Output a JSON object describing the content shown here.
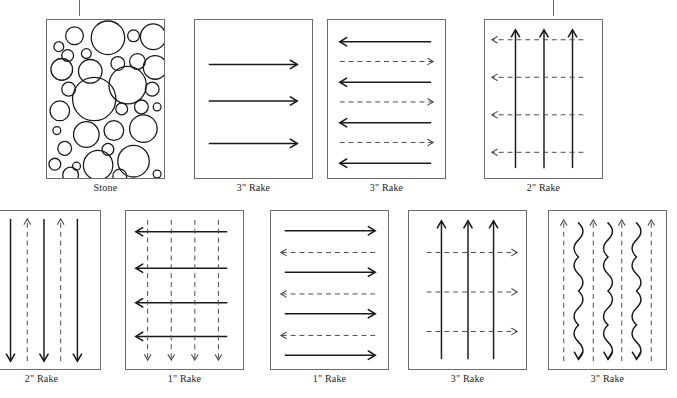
{
  "figure": {
    "title": "",
    "background_color": "#ffffff",
    "stroke_color": "#1a1a1a",
    "dashed_color": "#4a4a4a",
    "panel_border_color": "#6d6d6d",
    "tick_color": "#6b6b6b"
  },
  "top_ticks": [
    {
      "name": "tick-left",
      "x": 79,
      "y": 0,
      "height": 16
    },
    {
      "name": "tick-right",
      "x": 553,
      "y": 0,
      "height": 16
    }
  ],
  "panels": [
    {
      "id": "panel-stone",
      "caption": "Stone",
      "pattern": "stone-circles",
      "x": 46,
      "y": 19,
      "w": 119,
      "h": 160,
      "caption_x": 46,
      "caption_y": 182,
      "caption_w": 119,
      "clipped": false,
      "elements": {
        "circles": [
          {
            "cx": 28,
            "cy": 16,
            "r": 9
          },
          {
            "cx": 12,
            "cy": 27,
            "r": 5
          },
          {
            "cx": 21,
            "cy": 36,
            "r": 6
          },
          {
            "cx": 40,
            "cy": 34,
            "r": 5
          },
          {
            "cx": 62,
            "cy": 18,
            "r": 17
          },
          {
            "cx": 88,
            "cy": 16,
            "r": 6
          },
          {
            "cx": 108,
            "cy": 17,
            "r": 13
          },
          {
            "cx": 15,
            "cy": 50,
            "r": 11
          },
          {
            "cx": 44,
            "cy": 52,
            "r": 12
          },
          {
            "cx": 72,
            "cy": 44,
            "r": 7
          },
          {
            "cx": 92,
            "cy": 42,
            "r": 8
          },
          {
            "cx": 110,
            "cy": 48,
            "r": 12
          },
          {
            "cx": 22,
            "cy": 70,
            "r": 7
          },
          {
            "cx": 48,
            "cy": 80,
            "r": 22
          },
          {
            "cx": 82,
            "cy": 66,
            "r": 19
          },
          {
            "cx": 107,
            "cy": 70,
            "r": 7
          },
          {
            "cx": 13,
            "cy": 92,
            "r": 10
          },
          {
            "cx": 76,
            "cy": 90,
            "r": 6
          },
          {
            "cx": 96,
            "cy": 88,
            "r": 7
          },
          {
            "cx": 112,
            "cy": 88,
            "r": 4
          },
          {
            "cx": 10,
            "cy": 112,
            "r": 4
          },
          {
            "cx": 40,
            "cy": 116,
            "r": 13
          },
          {
            "cx": 68,
            "cy": 112,
            "r": 10
          },
          {
            "cx": 98,
            "cy": 110,
            "r": 14
          },
          {
            "cx": 18,
            "cy": 130,
            "r": 7
          },
          {
            "cx": 62,
            "cy": 131,
            "r": 6
          },
          {
            "cx": 8,
            "cy": 146,
            "r": 6
          },
          {
            "cx": 30,
            "cy": 148,
            "r": 4
          },
          {
            "cx": 52,
            "cy": 147,
            "r": 15
          },
          {
            "cx": 88,
            "cy": 143,
            "r": 16
          },
          {
            "cx": 24,
            "cy": 157,
            "r": 8
          },
          {
            "cx": 74,
            "cy": 158,
            "r": 7
          },
          {
            "cx": 112,
            "cy": 156,
            "r": 4
          }
        ]
      }
    },
    {
      "id": "panel-rake-3-right",
      "caption": "3\" Rake",
      "pattern": "solid-right-arrows",
      "x": 194,
      "y": 19,
      "w": 119,
      "h": 160,
      "caption_x": 194,
      "caption_y": 182,
      "caption_w": 119,
      "clipped": false,
      "elements": {
        "arrows": [
          {
            "dir": "right",
            "style": "solid",
            "x1": 14,
            "y1": 45,
            "x2": 104,
            "y2": 45
          },
          {
            "dir": "right",
            "style": "solid",
            "x1": 14,
            "y1": 82,
            "x2": 104,
            "y2": 82
          },
          {
            "dir": "right",
            "style": "solid",
            "x1": 14,
            "y1": 125,
            "x2": 104,
            "y2": 125
          }
        ]
      }
    },
    {
      "id": "panel-rake-3-alternating",
      "caption": "3\" Rake",
      "pattern": "alternating-horizontal-arrows",
      "x": 327,
      "y": 19,
      "w": 119,
      "h": 160,
      "caption_x": 327,
      "caption_y": 182,
      "caption_w": 119,
      "clipped": false,
      "elements": {
        "arrows": [
          {
            "dir": "left",
            "style": "solid",
            "x1": 105,
            "y1": 22,
            "x2": 12,
            "y2": 22
          },
          {
            "dir": "right",
            "style": "dashed",
            "x1": 12,
            "y1": 42,
            "x2": 107,
            "y2": 42
          },
          {
            "dir": "left",
            "style": "solid",
            "x1": 105,
            "y1": 63,
            "x2": 12,
            "y2": 63
          },
          {
            "dir": "right",
            "style": "dashed",
            "x1": 12,
            "y1": 83,
            "x2": 107,
            "y2": 83
          },
          {
            "dir": "left",
            "style": "solid",
            "x1": 105,
            "y1": 104,
            "x2": 12,
            "y2": 104
          },
          {
            "dir": "right",
            "style": "dashed",
            "x1": 12,
            "y1": 124,
            "x2": 107,
            "y2": 124
          },
          {
            "dir": "left",
            "style": "solid",
            "x1": 105,
            "y1": 145,
            "x2": 12,
            "y2": 145
          }
        ]
      }
    },
    {
      "id": "panel-rake-2-up-left",
      "caption": "2\" Rake",
      "pattern": "solid-up-dashed-left",
      "x": 484,
      "y": 19,
      "w": 119,
      "h": 160,
      "caption_x": 484,
      "caption_y": 182,
      "caption_w": 119,
      "clipped": false,
      "elements": {
        "arrows": [
          {
            "dir": "up",
            "style": "solid",
            "x1": 31,
            "y1": 150,
            "x2": 31,
            "y2": 10
          },
          {
            "dir": "up",
            "style": "solid",
            "x1": 60,
            "y1": 150,
            "x2": 60,
            "y2": 10
          },
          {
            "dir": "up",
            "style": "solid",
            "x1": 89,
            "y1": 150,
            "x2": 89,
            "y2": 10
          },
          {
            "dir": "left",
            "style": "dashed",
            "x1": 100,
            "y1": 20,
            "x2": 7,
            "y2": 20
          },
          {
            "dir": "left",
            "style": "dashed",
            "x1": 100,
            "y1": 58,
            "x2": 7,
            "y2": 58
          },
          {
            "dir": "left",
            "style": "dashed",
            "x1": 100,
            "y1": 96,
            "x2": 7,
            "y2": 96
          },
          {
            "dir": "left",
            "style": "dashed",
            "x1": 100,
            "y1": 134,
            "x2": 7,
            "y2": 134
          }
        ]
      }
    },
    {
      "id": "panel-rake-2-vertical",
      "caption": "2\" Rake",
      "pattern": "alternating-vertical-arrows",
      "x": -18,
      "y": 210,
      "w": 119,
      "h": 160,
      "caption_x": -18,
      "caption_y": 373,
      "caption_w": 119,
      "clipped": true,
      "elements": {
        "arrows": [
          {
            "dir": "up",
            "style": "dashed",
            "x1": 11,
            "y1": 152,
            "x2": 11,
            "y2": 8
          },
          {
            "dir": "down",
            "style": "solid",
            "x1": 28,
            "y1": 8,
            "x2": 28,
            "y2": 152
          },
          {
            "dir": "up",
            "style": "dashed",
            "x1": 45,
            "y1": 152,
            "x2": 45,
            "y2": 8
          },
          {
            "dir": "down",
            "style": "solid",
            "x1": 62,
            "y1": 8,
            "x2": 62,
            "y2": 152
          },
          {
            "dir": "up",
            "style": "dashed",
            "x1": 79,
            "y1": 152,
            "x2": 79,
            "y2": 8
          },
          {
            "dir": "down",
            "style": "solid",
            "x1": 96,
            "y1": 8,
            "x2": 96,
            "y2": 152
          }
        ]
      }
    },
    {
      "id": "panel-rake-1-grid",
      "caption": "1\" Rake",
      "pattern": "grid-left-and-down",
      "x": 125,
      "y": 210,
      "w": 119,
      "h": 160,
      "caption_x": 125,
      "caption_y": 373,
      "caption_w": 119,
      "clipped": false,
      "elements": {
        "arrows": [
          {
            "dir": "left",
            "style": "solid",
            "x1": 103,
            "y1": 21,
            "x2": 10,
            "y2": 21
          },
          {
            "dir": "left",
            "style": "solid",
            "x1": 103,
            "y1": 58,
            "x2": 10,
            "y2": 58
          },
          {
            "dir": "left",
            "style": "solid",
            "x1": 103,
            "y1": 93,
            "x2": 10,
            "y2": 93
          },
          {
            "dir": "left",
            "style": "solid",
            "x1": 103,
            "y1": 127,
            "x2": 10,
            "y2": 127
          },
          {
            "dir": "down",
            "style": "dashed",
            "x1": 22,
            "y1": 9,
            "x2": 22,
            "y2": 151
          },
          {
            "dir": "down",
            "style": "dashed",
            "x1": 46,
            "y1": 9,
            "x2": 46,
            "y2": 151
          },
          {
            "dir": "down",
            "style": "dashed",
            "x1": 70,
            "y1": 9,
            "x2": 70,
            "y2": 151
          },
          {
            "dir": "down",
            "style": "dashed",
            "x1": 94,
            "y1": 9,
            "x2": 94,
            "y2": 151
          }
        ]
      }
    },
    {
      "id": "panel-rake-1-alternating",
      "caption": "1\" Rake",
      "pattern": "alternating-horizontal-arrows",
      "x": 270,
      "y": 210,
      "w": 119,
      "h": 160,
      "caption_x": 270,
      "caption_y": 373,
      "caption_w": 119,
      "clipped": false,
      "elements": {
        "arrows": [
          {
            "dir": "right",
            "style": "solid",
            "x1": 14,
            "y1": 20,
            "x2": 106,
            "y2": 20
          },
          {
            "dir": "left",
            "style": "dashed",
            "x1": 106,
            "y1": 42,
            "x2": 10,
            "y2": 42
          },
          {
            "dir": "right",
            "style": "solid",
            "x1": 14,
            "y1": 62,
            "x2": 106,
            "y2": 62
          },
          {
            "dir": "left",
            "style": "dashed",
            "x1": 106,
            "y1": 84,
            "x2": 10,
            "y2": 84
          },
          {
            "dir": "right",
            "style": "solid",
            "x1": 14,
            "y1": 104,
            "x2": 106,
            "y2": 104
          },
          {
            "dir": "left",
            "style": "dashed",
            "x1": 106,
            "y1": 126,
            "x2": 10,
            "y2": 126
          },
          {
            "dir": "right",
            "style": "solid",
            "x1": 14,
            "y1": 146,
            "x2": 106,
            "y2": 146
          }
        ]
      }
    },
    {
      "id": "panel-rake-3-up-right",
      "caption": "3\" Rake",
      "pattern": "solid-up-dashed-right",
      "x": 408,
      "y": 210,
      "w": 119,
      "h": 160,
      "caption_x": 408,
      "caption_y": 373,
      "caption_w": 119,
      "clipped": false,
      "elements": {
        "arrows": [
          {
            "dir": "up",
            "style": "solid",
            "x1": 33,
            "y1": 150,
            "x2": 33,
            "y2": 10
          },
          {
            "dir": "up",
            "style": "solid",
            "x1": 60,
            "y1": 150,
            "x2": 60,
            "y2": 10
          },
          {
            "dir": "up",
            "style": "solid",
            "x1": 86,
            "y1": 150,
            "x2": 86,
            "y2": 10
          },
          {
            "dir": "right",
            "style": "dashed",
            "x1": 18,
            "y1": 42,
            "x2": 110,
            "y2": 42
          },
          {
            "dir": "right",
            "style": "dashed",
            "x1": 18,
            "y1": 82,
            "x2": 110,
            "y2": 82
          },
          {
            "dir": "right",
            "style": "dashed",
            "x1": 18,
            "y1": 122,
            "x2": 110,
            "y2": 122
          }
        ]
      }
    },
    {
      "id": "panel-rake-3-wavy",
      "caption": "3\" Rake",
      "pattern": "wavy-down-dashed-up",
      "x": 548,
      "y": 210,
      "w": 119,
      "h": 160,
      "caption_x": 548,
      "caption_y": 373,
      "caption_w": 119,
      "clipped": false,
      "elements": {
        "arrows": [
          {
            "dir": "up",
            "style": "dashed",
            "x1": 15,
            "y1": 152,
            "x2": 15,
            "y2": 9
          },
          {
            "dir": "up",
            "style": "dashed",
            "x1": 45,
            "y1": 152,
            "x2": 45,
            "y2": 9
          },
          {
            "dir": "up",
            "style": "dashed",
            "x1": 74,
            "y1": 152,
            "x2": 74,
            "y2": 9
          },
          {
            "dir": "up",
            "style": "dashed",
            "x1": 104,
            "y1": 152,
            "x2": 104,
            "y2": 9
          }
        ],
        "waves": [
          {
            "dir": "down",
            "style": "solid",
            "x": 30,
            "y_top": 12,
            "y_bottom": 150,
            "amplitude": 9
          },
          {
            "dir": "down",
            "style": "solid",
            "x": 60,
            "y_top": 12,
            "y_bottom": 150,
            "amplitude": 9
          },
          {
            "dir": "down",
            "style": "solid",
            "x": 89,
            "y_top": 12,
            "y_bottom": 150,
            "amplitude": 9
          }
        ]
      }
    }
  ]
}
